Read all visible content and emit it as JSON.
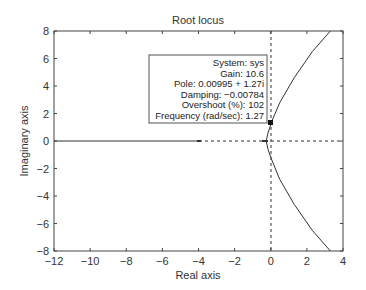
{
  "chart_data": {
    "type": "line",
    "title": "Root locus",
    "xlabel": "Real axis",
    "ylabel": "Imaginary axis",
    "xlim": [
      -12,
      4
    ],
    "ylim": [
      -8,
      8
    ],
    "xticks": [
      -12,
      -10,
      -8,
      -6,
      -4,
      -2,
      0,
      2,
      4
    ],
    "yticks": [
      -8,
      -6,
      -4,
      -2,
      0,
      2,
      4,
      6,
      8
    ],
    "xtick_labels": [
      "−12",
      "−10",
      "−8",
      "−6",
      "−4",
      "−2",
      "0",
      "2",
      "4"
    ],
    "ytick_labels": [
      "8",
      "6",
      "4",
      "2",
      "0",
      "−2",
      "−4",
      "−6",
      "−8"
    ],
    "grid": false,
    "series": [
      {
        "name": "real-axis-branch",
        "x": [
          -12,
          -4
        ],
        "y": [
          0,
          0
        ]
      },
      {
        "name": "upper-branch",
        "x": [
          -0.25,
          -0.15,
          0.0,
          0.01,
          0.5,
          1.3,
          2.3,
          3.3
        ],
        "y": [
          0,
          0.6,
          1.2,
          1.27,
          2.8,
          4.6,
          6.5,
          8
        ]
      },
      {
        "name": "lower-branch",
        "x": [
          -0.25,
          -0.15,
          0.0,
          0.5,
          1.3,
          2.3,
          3.3
        ],
        "y": [
          0,
          -0.6,
          -1.2,
          -2.8,
          -4.6,
          -6.5,
          -8
        ]
      }
    ],
    "markers": [
      {
        "x": -4,
        "y": 0
      },
      {
        "x": -0.25,
        "y": 0
      },
      {
        "x": 0.00995,
        "y": 1.27,
        "selected": true
      }
    ],
    "reference_lines": {
      "vertical_x": 0,
      "horizontal_y": 0,
      "style": "dashed"
    },
    "datatip": {
      "lines": [
        "System: sys",
        "Gain: 10.6",
        "Pole: 0.00995 + 1.27i",
        "Damping: −0.00784",
        "Overshoot (%): 102",
        "Frequency (rad/sec): 1.27"
      ]
    }
  }
}
